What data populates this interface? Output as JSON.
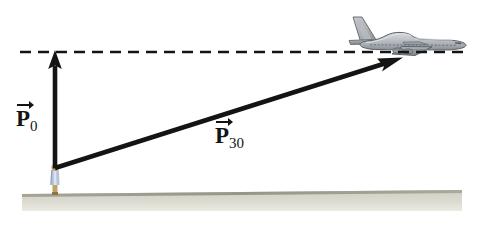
{
  "figure": {
    "background_color": "#ffffff",
    "width": 487,
    "height": 232
  },
  "labels": {
    "p0": {
      "base": "P",
      "subscript": "0",
      "full": "P0",
      "accent": "vector-arrow"
    },
    "p30": {
      "base": "P",
      "subscript": "30",
      "full": "P30",
      "accent": "vector-arrow"
    }
  },
  "colors": {
    "vector": "#141414",
    "dashed_line": "#141414",
    "ground_top": "#9a9a8c",
    "ground_fill": "#cfcec2",
    "ground_fill_light": "#e3e2da",
    "plane_body": "#b9bdc1",
    "plane_outline": "#5b6065",
    "plane_shadow": "#7e858b",
    "person_shirt": "#aebfd6",
    "person_skin": "#c9a66b"
  },
  "elements": {
    "dashed_line": {
      "name": "horizontal-reference-line",
      "style": "dashed",
      "y": 52
    },
    "vector_p0": {
      "name": "vertical-momentum-vector",
      "from_x": 55,
      "from_y": 168,
      "to_x": 55,
      "to_y": 53
    },
    "vector_p30": {
      "name": "diagonal-momentum-vector",
      "from_x": 55,
      "from_y": 168,
      "to_x": 402,
      "to_y": 58
    },
    "airplane": {
      "name": "airplane-illustration",
      "type": "jetliner",
      "facing": "right"
    },
    "observer": {
      "name": "observer-figure",
      "type": "person"
    },
    "ground": {
      "name": "ground-strip"
    }
  }
}
